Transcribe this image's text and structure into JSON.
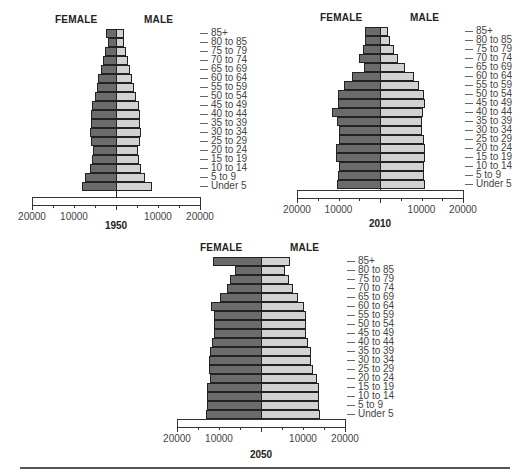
{
  "labels": {
    "female": "FEMALE",
    "male": "MALE",
    "age_groups": [
      "85+",
      "80 to 85",
      "75 to 79",
      "70 to 74",
      "65 to 69",
      "60 to 64",
      "55 to 59",
      "50 to 54",
      "45 to 49",
      "40 to 44",
      "35 to 39",
      "30 to 34",
      "25 to 29",
      "20 to 24",
      "15 to 19",
      "10 to 14",
      "5 to 9",
      "Under 5"
    ],
    "ticks": [
      "20000",
      "10000",
      "10000",
      "20000"
    ]
  },
  "colors": {
    "female": "#6b6b6b",
    "male": "#d2d2d2",
    "outline": "#222222"
  },
  "chart_data": [
    {
      "type": "bar",
      "orientation": "horizontal-pyramid",
      "title": "1950",
      "categories": [
        "85+",
        "80 to 85",
        "75 to 79",
        "70 to 74",
        "65 to 69",
        "60 to 64",
        "55 to 59",
        "50 to 54",
        "45 to 49",
        "40 to 44",
        "35 to 39",
        "30 to 34",
        "25 to 29",
        "20 to 24",
        "15 to 19",
        "10 to 14",
        "5 to 9",
        "Under 5"
      ],
      "series": [
        {
          "name": "FEMALE",
          "values": [
            2300,
            1800,
            2700,
            3100,
            3600,
            4200,
            4600,
            5100,
            5700,
            5900,
            6000,
            6200,
            5900,
            5400,
            5600,
            6300,
            7500,
            8000
          ]
        },
        {
          "name": "MALE",
          "values": [
            1900,
            1800,
            2400,
            2900,
            3400,
            3900,
            4300,
            4800,
            5400,
            5600,
            5700,
            5900,
            5600,
            5300,
            5500,
            6000,
            7000,
            8500
          ]
        }
      ],
      "xlabel": "",
      "ylabel": "",
      "xlim": [
        -20000,
        20000
      ],
      "ticks": [
        20000,
        10000,
        0,
        10000,
        20000
      ],
      "legend": [
        "FEMALE",
        "MALE"
      ]
    },
    {
      "type": "bar",
      "orientation": "horizontal-pyramid",
      "title": "2010",
      "categories": [
        "85+",
        "80 to 85",
        "75 to 79",
        "70 to 74",
        "65 to 69",
        "60 to 64",
        "55 to 59",
        "50 to 54",
        "45 to 49",
        "40 to 44",
        "35 to 39",
        "30 to 34",
        "25 to 29",
        "20 to 24",
        "15 to 19",
        "10 to 14",
        "5 to 9",
        "Under 5"
      ],
      "series": [
        {
          "name": "FEMALE",
          "values": [
            3700,
            3500,
            4000,
            5000,
            3900,
            6700,
            8700,
            10100,
            10200,
            11600,
            10400,
            10000,
            10000,
            10600,
            10500,
            9900,
            10100,
            10300
          ]
        },
        {
          "name": "MALE",
          "values": [
            2000,
            2400,
            3400,
            4300,
            6000,
            8300,
            9500,
            10500,
            10800,
            10300,
            10000,
            10000,
            10700,
            10800,
            10900,
            10500,
            10600,
            10800
          ]
        }
      ],
      "xlabel": "",
      "ylabel": "",
      "xlim": [
        -20000,
        20000
      ],
      "ticks": [
        20000,
        10000,
        0,
        10000,
        20000
      ],
      "legend": [
        "FEMALE",
        "MALE"
      ]
    },
    {
      "type": "bar",
      "orientation": "horizontal-pyramid",
      "title": "2050",
      "categories": [
        "85+",
        "80 to 85",
        "75 to 79",
        "70 to 74",
        "65 to 69",
        "60 to 64",
        "55 to 59",
        "50 to 54",
        "45 to 49",
        "40 to 44",
        "35 to 39",
        "30 to 34",
        "25 to 29",
        "20 to 24",
        "15 to 19",
        "10 to 14",
        "5 to 9",
        "Under 5"
      ],
      "series": [
        {
          "name": "FEMALE",
          "values": [
            11400,
            6300,
            7300,
            8200,
            9800,
            11800,
            11100,
            11100,
            11300,
            11700,
            12200,
            12400,
            12300,
            12200,
            12800,
            12800,
            12900,
            13100
          ]
        },
        {
          "name": "MALE",
          "values": [
            6900,
            5600,
            6700,
            7600,
            8900,
            10200,
            10600,
            10600,
            10800,
            11300,
            11800,
            11900,
            12400,
            13300,
            13900,
            13900,
            13900,
            14000
          ]
        }
      ],
      "xlabel": "",
      "ylabel": "",
      "xlim": [
        -20000,
        20000
      ],
      "ticks": [
        20000,
        10000,
        0,
        10000,
        20000
      ],
      "legend": [
        "FEMALE",
        "MALE"
      ]
    }
  ]
}
